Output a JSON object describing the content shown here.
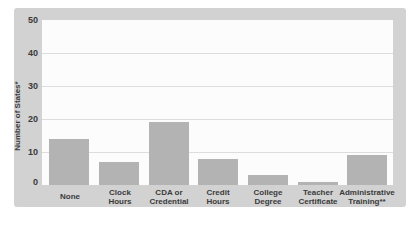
{
  "chart_data": {
    "type": "bar",
    "categories": [
      "None",
      "Clock Hours",
      "CDA or Credential",
      "Credit Hours",
      "College Degree",
      "Teacher Certificate",
      "Administrative Training**"
    ],
    "values": [
      14,
      7,
      19,
      8,
      3,
      1,
      9
    ],
    "title": "",
    "xlabel": "",
    "ylabel": "Number of States*",
    "ylim": [
      0,
      50
    ],
    "yticks": [
      0,
      10,
      20,
      30,
      40,
      50
    ],
    "grid": true,
    "legend": "none",
    "bar_color": "#b3b3b3",
    "panel_background": "#d2d2d2",
    "plot_background": "#fcfcfc",
    "gridline_color": "#dddddd",
    "text_color": "#3a3a3a"
  },
  "display": {
    "x_tick_lines": [
      "None",
      "Clock\nHours",
      "CDA or\nCredential",
      "Credit\nHours",
      "College\nDegree",
      "Teacher\nCertificate",
      "Administrative\nTraining**"
    ]
  }
}
